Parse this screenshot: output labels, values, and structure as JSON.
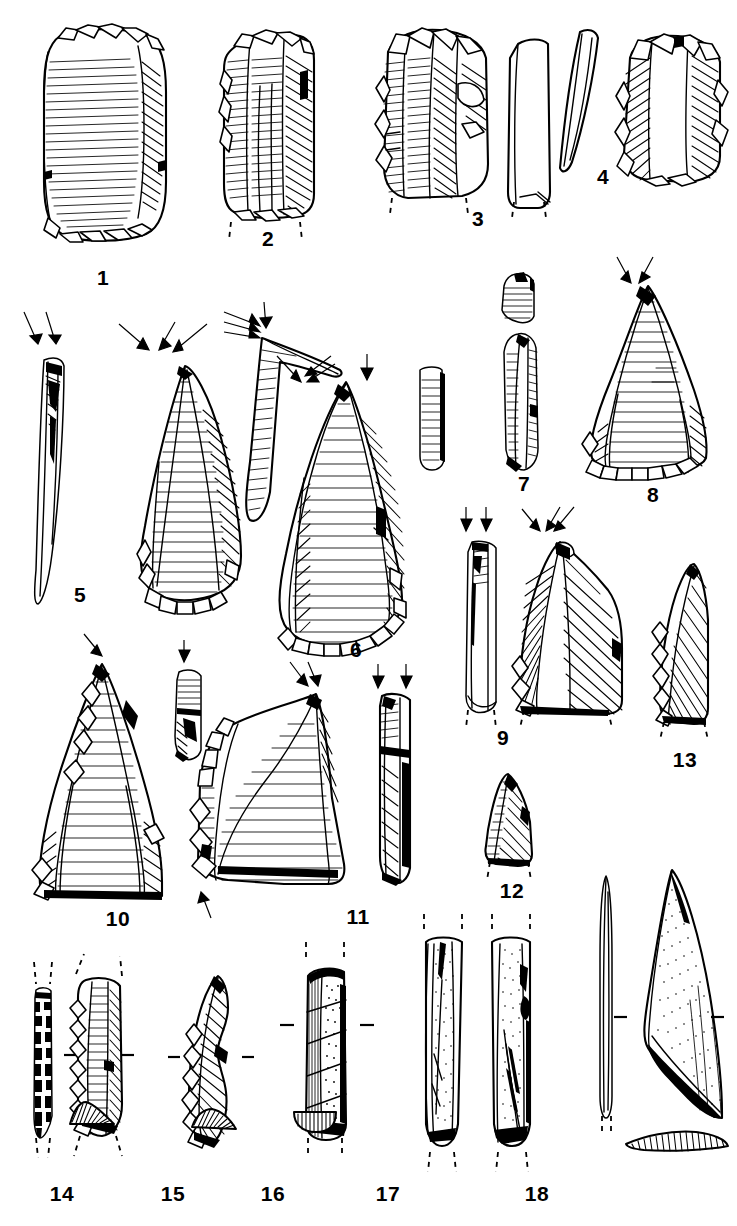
{
  "plate": {
    "kind": "archaeological-lithic-plate",
    "background_color": "#ffffff",
    "ink_color": "#000000",
    "width": 737,
    "height": 1226,
    "caption_font_weight": "bold",
    "description": "Line-drawing plate of flaked stone tools, bone points and cross-sections, numbered 1 to 18"
  },
  "figures": [
    {
      "number": "1",
      "label": "1",
      "label_x": 103,
      "label_y": 277,
      "views": 1,
      "type": "side-scraper-flake",
      "arrows": 0,
      "has_cross_section": false,
      "has_break_dashes": false
    },
    {
      "number": "2",
      "label": "2",
      "label_x": 268,
      "label_y": 238,
      "views": 1,
      "type": "retouched-blade",
      "arrows": 0,
      "has_cross_section": false,
      "has_break_dashes": true
    },
    {
      "number": "3",
      "label": "3",
      "label_x": 478,
      "label_y": 218,
      "views": 2,
      "type": "core-fragment-with-profile",
      "arrows": 0,
      "has_cross_section": false,
      "has_break_dashes": true
    },
    {
      "number": "4",
      "label": "4",
      "label_x": 603,
      "label_y": 176,
      "views": 2,
      "type": "flake-with-profile",
      "arrows": 0,
      "has_cross_section": false,
      "has_break_dashes": false
    },
    {
      "number": "5",
      "label": "5",
      "label_x": 80,
      "label_y": 594,
      "views": 2,
      "type": "pointed-flake-with-profile",
      "arrows": 4,
      "has_cross_section": false,
      "has_break_dashes": false
    },
    {
      "number": "6",
      "label": "6",
      "label_x": 356,
      "label_y": 649,
      "views": 3,
      "type": "large-point-with-profile-and-butt",
      "arrows": 8,
      "has_cross_section": false,
      "has_break_dashes": false
    },
    {
      "number": "7",
      "label": "7",
      "label_x": 524,
      "label_y": 483,
      "views": 2,
      "type": "narrow-blade-profile-pair",
      "arrows": 0,
      "has_cross_section": false,
      "has_break_dashes": false
    },
    {
      "number": "8",
      "label": "8",
      "label_x": 653,
      "label_y": 494,
      "views": 1,
      "type": "triangular-point",
      "arrows": 2,
      "has_cross_section": false,
      "has_break_dashes": false
    },
    {
      "number": "9",
      "label": "9",
      "label_x": 503,
      "label_y": 737,
      "views": 2,
      "type": "blade-fragment-with-profile",
      "arrows": 5,
      "has_cross_section": false,
      "has_break_dashes": true
    },
    {
      "number": "10",
      "label": "10",
      "label_x": 118,
      "label_y": 918,
      "views": 2,
      "type": "convergent-point-with-profile",
      "arrows": 2,
      "has_cross_section": false,
      "has_break_dashes": false
    },
    {
      "number": "11",
      "label": "11",
      "label_x": 358,
      "label_y": 916,
      "views": 2,
      "type": "notched-flake-with-profile",
      "arrows": 5,
      "has_cross_section": false,
      "has_break_dashes": false
    },
    {
      "number": "12",
      "label": "12",
      "label_x": 512,
      "label_y": 890,
      "views": 1,
      "type": "small-triangular-fragment",
      "arrows": 0,
      "has_cross_section": false,
      "has_break_dashes": true
    },
    {
      "number": "13",
      "label": "13",
      "label_x": 685,
      "label_y": 759,
      "views": 1,
      "type": "backed-blade-fragment",
      "arrows": 0,
      "has_cross_section": false,
      "has_break_dashes": true
    },
    {
      "number": "14",
      "label": "14",
      "label_x": 62,
      "label_y": 1193,
      "views": 2,
      "type": "bladelet-with-profile",
      "arrows": 0,
      "has_cross_section": true,
      "has_break_dashes": true
    },
    {
      "number": "15",
      "label": "15",
      "label_x": 173,
      "label_y": 1193,
      "views": 1,
      "type": "retouched-bladelet",
      "arrows": 0,
      "has_cross_section": true,
      "has_break_dashes": false
    },
    {
      "number": "16",
      "label": "16",
      "label_x": 273,
      "label_y": 1193,
      "views": 1,
      "type": "rectangular-blade",
      "arrows": 0,
      "has_cross_section": true,
      "has_break_dashes": true
    },
    {
      "number": "17",
      "label": "17",
      "label_x": 388,
      "label_y": 1193,
      "views": 2,
      "type": "bone-point-two-faces",
      "arrows": 0,
      "has_cross_section": false,
      "has_break_dashes": true
    },
    {
      "number": "18",
      "label": "18",
      "label_x": 537,
      "label_y": 1193,
      "views": 2,
      "type": "bone-blade-with-profile",
      "arrows": 0,
      "has_cross_section": true,
      "has_break_dashes": true
    }
  ]
}
